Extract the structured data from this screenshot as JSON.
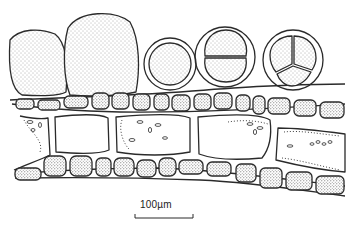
{
  "figure": {
    "type": "botanical line drawing (stippled)",
    "colors": {
      "ink": "#2a2a2a",
      "background": "#ffffff",
      "stipple": "#555555"
    },
    "elements": {
      "large_cells": 2,
      "single_spore": 1,
      "bisected_spore": 1,
      "tripartite_tetraspore": 1,
      "cortical_cell_rows": 2,
      "medullary_cells": 3
    }
  },
  "scale_bar": {
    "label": "100µm"
  }
}
